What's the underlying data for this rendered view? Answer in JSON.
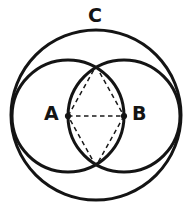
{
  "figure": {
    "background_color": "#ffffff",
    "stroke_color": "#141414",
    "dash_color": "#1a1a1a",
    "width": 189,
    "height": 217
  },
  "labels": {
    "circle_c": "C",
    "point_a": "A",
    "point_b": "B"
  },
  "chart_data": {
    "type": "diagram",
    "title": "",
    "elements": {
      "circles": [
        {
          "name": "C",
          "label": "C",
          "role": "circumscribing-circle",
          "cx": 96,
          "cy": 115,
          "r": 85,
          "stroke_width": 3.0,
          "dashed": false
        },
        {
          "name": "A",
          "label": "A",
          "role": "left-circle",
          "cx": 68,
          "cy": 116,
          "r": 56,
          "stroke_width": 3.0,
          "dashed": false
        },
        {
          "name": "B",
          "label": "B",
          "role": "right-circle",
          "cx": 124,
          "cy": 116,
          "r": 56,
          "stroke_width": 3.0,
          "dashed": false
        }
      ],
      "points": [
        {
          "name": "A",
          "label": "A",
          "x": 68,
          "y": 116,
          "marker": "dot"
        },
        {
          "name": "B",
          "label": "B",
          "x": 124,
          "y": 116,
          "marker": "dot"
        },
        {
          "name": "top-cusp",
          "label": "",
          "x": 96,
          "y": 66,
          "marker": "none"
        },
        {
          "name": "bottom-cusp",
          "label": "",
          "x": 96,
          "y": 166,
          "marker": "none"
        }
      ],
      "dashed_segments": [
        {
          "name": "diameter-AB",
          "x1": 68,
          "y1": 116,
          "x2": 124,
          "y2": 116
        },
        {
          "name": "A-to-top-cusp",
          "x1": 68,
          "y1": 116,
          "x2": 96,
          "y2": 66
        },
        {
          "name": "top-cusp-to-B",
          "x1": 96,
          "y1": 66,
          "x2": 124,
          "y2": 116
        },
        {
          "name": "B-to-bottom-cusp",
          "x1": 124,
          "y1": 116,
          "x2": 96,
          "y2": 166
        },
        {
          "name": "bottom-cusp-to-A",
          "x1": 96,
          "y1": 166,
          "x2": 68,
          "y2": 116
        }
      ]
    }
  }
}
